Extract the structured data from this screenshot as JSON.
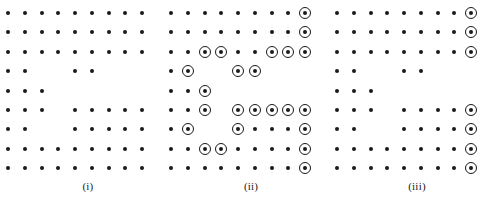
{
  "figure": {
    "type": "lattice-diagram",
    "background_color": "#ffffff",
    "ink_color": "#1a1a1a",
    "dot_diameter_px": 4,
    "ring_diameter_px": 12,
    "grid": {
      "columns": 9,
      "rows": 9,
      "column_spacing_px": 16.75,
      "row_spacing_px": 19.4,
      "first_row_y_px": 13,
      "label_y_px": 180
    },
    "panels": [
      {
        "id": "panel-i",
        "label": "(i)",
        "origin_x_px": 8,
        "width_px": 160,
        "dots": [
          [
            1,
            1,
            1,
            1,
            1,
            1,
            1,
            1,
            1
          ],
          [
            1,
            1,
            1,
            1,
            1,
            1,
            1,
            1,
            1
          ],
          [
            1,
            1,
            1,
            1,
            1,
            1,
            1,
            1,
            1
          ],
          [
            1,
            1,
            0,
            0,
            1,
            1,
            0,
            0,
            0
          ],
          [
            1,
            1,
            1,
            0,
            0,
            0,
            0,
            0,
            0
          ],
          [
            1,
            1,
            1,
            0,
            1,
            1,
            1,
            1,
            1
          ],
          [
            1,
            1,
            0,
            0,
            1,
            1,
            1,
            1,
            1
          ],
          [
            1,
            1,
            1,
            1,
            1,
            1,
            1,
            1,
            1
          ],
          [
            1,
            1,
            1,
            1,
            1,
            1,
            1,
            1,
            1
          ]
        ],
        "rings": [
          [
            0,
            0,
            0,
            0,
            0,
            0,
            0,
            0,
            0
          ],
          [
            0,
            0,
            0,
            0,
            0,
            0,
            0,
            0,
            0
          ],
          [
            0,
            0,
            0,
            0,
            0,
            0,
            0,
            0,
            0
          ],
          [
            0,
            0,
            0,
            0,
            0,
            0,
            0,
            0,
            0
          ],
          [
            0,
            0,
            0,
            0,
            0,
            0,
            0,
            0,
            0
          ],
          [
            0,
            0,
            0,
            0,
            0,
            0,
            0,
            0,
            0
          ],
          [
            0,
            0,
            0,
            0,
            0,
            0,
            0,
            0,
            0
          ],
          [
            0,
            0,
            0,
            0,
            0,
            0,
            0,
            0,
            0
          ],
          [
            0,
            0,
            0,
            0,
            0,
            0,
            0,
            0,
            0
          ]
        ]
      },
      {
        "id": "panel-ii",
        "label": "(ii)",
        "origin_x_px": 171,
        "width_px": 160,
        "dots": [
          [
            1,
            1,
            1,
            1,
            1,
            1,
            1,
            1,
            1
          ],
          [
            1,
            1,
            1,
            1,
            1,
            1,
            1,
            1,
            1
          ],
          [
            1,
            1,
            1,
            1,
            1,
            1,
            1,
            1,
            1
          ],
          [
            1,
            1,
            0,
            0,
            1,
            1,
            0,
            0,
            0
          ],
          [
            1,
            1,
            1,
            0,
            0,
            0,
            0,
            0,
            0
          ],
          [
            1,
            1,
            1,
            0,
            1,
            1,
            1,
            1,
            1
          ],
          [
            1,
            1,
            0,
            0,
            1,
            1,
            1,
            1,
            1
          ],
          [
            1,
            1,
            1,
            1,
            1,
            1,
            1,
            1,
            1
          ],
          [
            1,
            1,
            1,
            1,
            1,
            1,
            1,
            1,
            1
          ]
        ],
        "rings": [
          [
            0,
            0,
            0,
            0,
            0,
            0,
            0,
            0,
            1
          ],
          [
            0,
            0,
            0,
            0,
            0,
            0,
            0,
            0,
            1
          ],
          [
            0,
            0,
            1,
            1,
            0,
            0,
            1,
            1,
            1
          ],
          [
            0,
            1,
            0,
            0,
            1,
            1,
            0,
            0,
            0
          ],
          [
            0,
            0,
            1,
            0,
            0,
            0,
            0,
            0,
            0
          ],
          [
            0,
            0,
            1,
            0,
            1,
            1,
            1,
            1,
            1
          ],
          [
            0,
            1,
            0,
            0,
            1,
            0,
            0,
            0,
            1
          ],
          [
            0,
            0,
            1,
            1,
            0,
            0,
            0,
            0,
            1
          ],
          [
            0,
            0,
            0,
            0,
            0,
            0,
            0,
            0,
            1
          ]
        ]
      },
      {
        "id": "panel-iii",
        "label": "(iii)",
        "origin_x_px": 337,
        "width_px": 160,
        "dots": [
          [
            1,
            1,
            1,
            1,
            1,
            1,
            1,
            1,
            1
          ],
          [
            1,
            1,
            1,
            1,
            1,
            1,
            1,
            1,
            1
          ],
          [
            1,
            1,
            1,
            1,
            1,
            1,
            1,
            1,
            1
          ],
          [
            1,
            1,
            0,
            0,
            1,
            1,
            0,
            0,
            0
          ],
          [
            1,
            1,
            1,
            0,
            0,
            0,
            0,
            0,
            0
          ],
          [
            1,
            1,
            1,
            0,
            1,
            1,
            1,
            1,
            1
          ],
          [
            1,
            1,
            0,
            0,
            1,
            1,
            1,
            1,
            1
          ],
          [
            1,
            1,
            1,
            1,
            1,
            1,
            1,
            1,
            1
          ],
          [
            1,
            1,
            1,
            1,
            1,
            1,
            1,
            1,
            1
          ]
        ],
        "rings": [
          [
            0,
            0,
            0,
            0,
            0,
            0,
            0,
            0,
            1
          ],
          [
            0,
            0,
            0,
            0,
            0,
            0,
            0,
            0,
            1
          ],
          [
            0,
            0,
            0,
            0,
            0,
            0,
            0,
            0,
            1
          ],
          [
            0,
            0,
            0,
            0,
            0,
            0,
            0,
            0,
            0
          ],
          [
            0,
            0,
            0,
            0,
            0,
            0,
            0,
            0,
            0
          ],
          [
            0,
            0,
            0,
            0,
            0,
            0,
            0,
            0,
            1
          ],
          [
            0,
            0,
            0,
            0,
            0,
            0,
            0,
            0,
            1
          ],
          [
            0,
            0,
            0,
            0,
            0,
            0,
            0,
            0,
            1
          ],
          [
            0,
            0,
            0,
            0,
            0,
            0,
            0,
            0,
            1
          ]
        ]
      }
    ]
  }
}
